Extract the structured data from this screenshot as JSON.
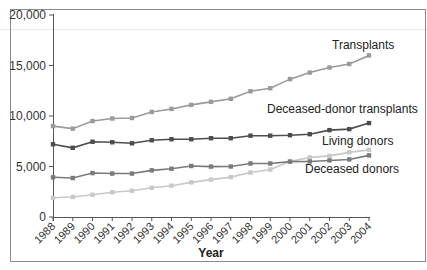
{
  "chart_data": {
    "type": "line",
    "title": "",
    "xlabel": "Year",
    "ylabel": "",
    "ylim": [
      0,
      20000
    ],
    "yticks": [
      0,
      5000,
      10000,
      15000,
      20000
    ],
    "ytick_labels": [
      "0",
      "5,000",
      "10,000",
      "15,000",
      "20,000"
    ],
    "grid": false,
    "legend_position": "inline-labels-right",
    "x": [
      "1988",
      "1989",
      "1990",
      "1991",
      "1992",
      "1993",
      "1994",
      "1995",
      "1996",
      "1997",
      "1998",
      "1999",
      "2000",
      "2001",
      "2002",
      "2003",
      "2004"
    ],
    "series": [
      {
        "name": "Transplants",
        "color": "#9a9a9a",
        "values": [
          9000,
          8750,
          9500,
          9750,
          9800,
          10400,
          10700,
          11100,
          11400,
          11700,
          12450,
          12750,
          13650,
          14300,
          14800,
          15150,
          16000
        ]
      },
      {
        "name": "Deceased-donor transplants",
        "color": "#4d4d4d",
        "values": [
          7200,
          6850,
          7450,
          7400,
          7300,
          7600,
          7700,
          7700,
          7800,
          7800,
          8050,
          8050,
          8100,
          8200,
          8600,
          8700,
          9300
        ]
      },
      {
        "name": "Living donors",
        "color": "#c8c8c8",
        "values": [
          1900,
          1980,
          2200,
          2450,
          2600,
          2900,
          3100,
          3430,
          3700,
          3950,
          4400,
          4700,
          5500,
          5900,
          6050,
          6400,
          6650
        ]
      },
      {
        "name": "Deceased donors",
        "color": "#7a7a7a",
        "values": [
          3930,
          3860,
          4350,
          4300,
          4300,
          4620,
          4780,
          5050,
          4990,
          5000,
          5300,
          5300,
          5480,
          5500,
          5600,
          5700,
          6100
        ]
      }
    ],
    "annotations": [
      {
        "text": "Transplants",
        "x": 332,
        "y": 49
      },
      {
        "text": "Deceased-donor transplants",
        "x": 267,
        "y": 113
      },
      {
        "text": "Living donors",
        "x": 322,
        "y": 145
      },
      {
        "text": "Deceased donors",
        "x": 305,
        "y": 173
      }
    ]
  },
  "labels": {
    "xlabel": "Year"
  }
}
